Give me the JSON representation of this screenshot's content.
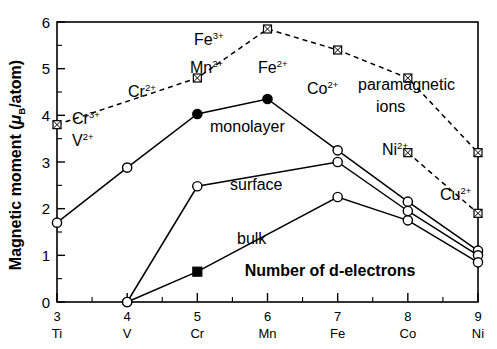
{
  "chart_data": {
    "type": "line",
    "title": "",
    "xlabel": "Number of d-electrons",
    "ylabel": "Magnetic moment (μ_B/atom)",
    "ylabel_parts": {
      "main": "Magnetic moment (",
      "mu": "μ",
      "sub": "B",
      "tail": "/atom)"
    },
    "xlim": [
      3,
      9
    ],
    "ylim": [
      0,
      6
    ],
    "grid": false,
    "legend": "inline-annotations",
    "x": [
      3,
      4,
      5,
      6,
      7,
      8,
      9
    ],
    "xticklabels": [
      "3",
      "4",
      "5",
      "6",
      "7",
      "8",
      "9"
    ],
    "x_elements": [
      "Ti",
      "V",
      "Cr",
      "Mn",
      "Fe",
      "Co",
      "Ni"
    ],
    "yticklabels": [
      "0",
      "1",
      "2",
      "3",
      "4",
      "5",
      "6"
    ],
    "yticks": [
      0,
      1,
      2,
      3,
      4,
      5,
      6
    ],
    "y_minor_step": 0.5,
    "series": [
      {
        "name": "monolayer",
        "marker": "circle",
        "linestyle": "solid",
        "x": [
          3,
          4,
          5,
          6,
          7,
          8,
          9
        ],
        "values": [
          1.7,
          2.88,
          4.03,
          4.35,
          3.25,
          2.15,
          1.1
        ],
        "filled_points": [
          5,
          6
        ]
      },
      {
        "name": "surface",
        "marker": "circle",
        "linestyle": "solid",
        "x": [
          4,
          5,
          7,
          8,
          9
        ],
        "values": [
          0.0,
          2.48,
          3.0,
          1.95,
          1.0
        ],
        "filled_points": []
      },
      {
        "name": "bulk",
        "marker": "circle",
        "linestyle": "solid",
        "x": [
          4,
          5,
          7,
          8,
          9
        ],
        "values": [
          0.0,
          0.65,
          2.25,
          1.75,
          0.85
        ],
        "square_points": [
          5
        ]
      },
      {
        "name": "paramagnetic ions",
        "marker": "crossed-square",
        "linestyle": "dashed",
        "x": [
          3,
          5,
          6,
          7,
          8,
          9
        ],
        "values": [
          3.8,
          4.8,
          5.85,
          5.4,
          4.8,
          3.2
        ]
      },
      {
        "name": "paramagnetic ions tail",
        "marker": "crossed-square",
        "linestyle": "dashed",
        "x": [
          8,
          9
        ],
        "values": [
          3.2,
          1.9
        ]
      }
    ],
    "annotations": [
      {
        "id": "ann-cr3",
        "base": "Cr",
        "sup": "3+",
        "x_px": 72,
        "y_px": 124
      },
      {
        "id": "ann-v2",
        "base": "V",
        "sup": "2+",
        "x_px": 72,
        "y_px": 146
      },
      {
        "id": "ann-cr2",
        "base": "Cr",
        "sup": "2+",
        "x_px": 128,
        "y_px": 97
      },
      {
        "id": "ann-fe3",
        "base": "Fe",
        "sup": "3+",
        "x_px": 194,
        "y_px": 45
      },
      {
        "id": "ann-mn2",
        "base": "Mn",
        "sup": "2+",
        "x_px": 190,
        "y_px": 73
      },
      {
        "id": "ann-fe2",
        "base": "Fe",
        "sup": "2+",
        "x_px": 258,
        "y_px": 73
      },
      {
        "id": "ann-co2",
        "base": "Co",
        "sup": "2+",
        "x_px": 307,
        "y_px": 94
      },
      {
        "id": "ann-ni2",
        "base": "Ni",
        "sup": "2+",
        "x_px": 382,
        "y_px": 155
      },
      {
        "id": "ann-cu2",
        "base": "Cu",
        "sup": "2+",
        "x_px": 440,
        "y_px": 200
      }
    ],
    "text_labels": [
      {
        "id": "lbl-monolayer",
        "text": "monolayer",
        "x_px": 210,
        "y_px": 132
      },
      {
        "id": "lbl-surface",
        "text": "surface",
        "x_px": 230,
        "y_px": 190
      },
      {
        "id": "lbl-bulk",
        "text": "bulk",
        "x_px": 237,
        "y_px": 244
      },
      {
        "id": "lbl-para-1",
        "text": "paramagnetic",
        "x_px": 358,
        "y_px": 90
      },
      {
        "id": "lbl-para-2",
        "text": "ions",
        "x_px": 376,
        "y_px": 112
      }
    ]
  }
}
